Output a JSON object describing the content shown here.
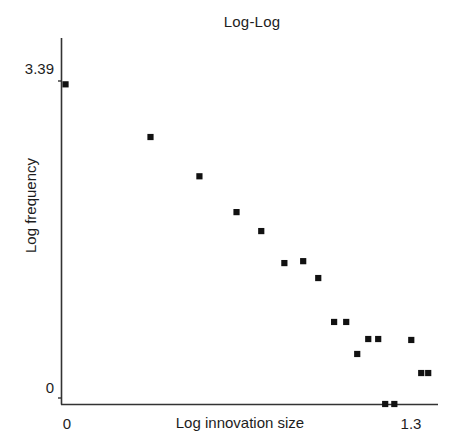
{
  "chart_data": {
    "type": "scatter",
    "title": "Log-Log",
    "xlabel": "Log innovation size",
    "ylabel": "Log frequency",
    "xlim": [
      0,
      1.4
    ],
    "ylim": [
      -0.09,
      3.8
    ],
    "grid": false,
    "legend": "none",
    "marker": "square",
    "marker_color": "#111111",
    "axis_color": "#333333",
    "x_ticks": [
      {
        "value": 0,
        "label": "0"
      },
      {
        "value": 1.3,
        "label": "1.3"
      }
    ],
    "y_ticks": [
      {
        "value": 0,
        "label": "0"
      },
      {
        "value": 3.39,
        "label": "3.39"
      }
    ],
    "points": [
      {
        "x": 0.015,
        "y": 3.355
      },
      {
        "x": 0.331,
        "y": 2.802
      },
      {
        "x": 0.513,
        "y": 2.39
      },
      {
        "x": 0.651,
        "y": 2.014
      },
      {
        "x": 0.743,
        "y": 1.815
      },
      {
        "x": 0.829,
        "y": 1.479
      },
      {
        "x": 0.899,
        "y": 1.499
      },
      {
        "x": 0.955,
        "y": 1.322
      },
      {
        "x": 1.014,
        "y": 0.861
      },
      {
        "x": 1.059,
        "y": 0.861
      },
      {
        "x": 1.1,
        "y": 0.525
      },
      {
        "x": 1.141,
        "y": 0.682
      },
      {
        "x": 1.178,
        "y": 0.682
      },
      {
        "x": 1.301,
        "y": 0.672
      },
      {
        "x": 1.338,
        "y": 0.325
      },
      {
        "x": 1.364,
        "y": 0.325
      },
      {
        "x": 1.204,
        "y": 0.0
      },
      {
        "x": 1.238,
        "y": 0.0
      }
    ]
  }
}
